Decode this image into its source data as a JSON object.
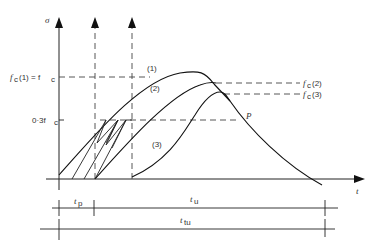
{
  "diagram": {
    "y_axis_label": "σ",
    "x_axis_label": "t",
    "levels": {
      "fc1": "f",
      "fc1_label_prefix": "f",
      "fc1_full": "fc(1) = fc",
      "fc1_label": "(1) = f",
      "fc2_label": "(2)",
      "fc3_label": "(3)",
      "point_03": "0·3f"
    },
    "curve_labels": {
      "c1": "(1)",
      "c2": "(2)",
      "c3": "(3)",
      "p": "P"
    },
    "durations": {
      "tp": "t",
      "tp_sub": "p",
      "tu": "t",
      "tu_sub": "u",
      "ttu": "t",
      "ttu_sub": "tu"
    },
    "subscript_c": "c"
  }
}
